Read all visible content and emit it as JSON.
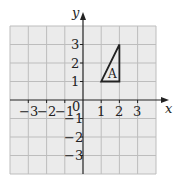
{
  "diagram": {
    "type": "coordinate-grid",
    "x_axis_label": "x",
    "y_axis_label": "y",
    "x_range": [
      -4,
      4
    ],
    "y_range": [
      -4,
      4
    ],
    "x_tick_labels": [
      "-3",
      "-2",
      "-1",
      "1",
      "2",
      "3"
    ],
    "y_tick_labels": [
      "3",
      "2",
      "1",
      "-1",
      "-2",
      "-3"
    ],
    "origin_label": "0",
    "shape": {
      "name": "triangle",
      "label": "A",
      "vertices": [
        [
          1,
          1
        ],
        [
          2,
          1
        ],
        [
          2,
          3
        ]
      ]
    },
    "colors": {
      "grid_fill": "#ebebeb",
      "grid_line": "#bdbdbd",
      "axis": "#222222",
      "shape_stroke": "#222222"
    }
  },
  "labels": {
    "x_axis": "x",
    "y_axis": "y",
    "origin": "0",
    "x_neg3": "−3",
    "x_neg2": "−2",
    "x_neg1": "−1",
    "x_1": "1",
    "x_2": "2",
    "x_3": "3",
    "y_3": "3",
    "y_2": "2",
    "y_1": "1",
    "y_neg1": "−1",
    "y_neg2": "−2",
    "y_neg3": "−3",
    "shape_label": "A"
  }
}
